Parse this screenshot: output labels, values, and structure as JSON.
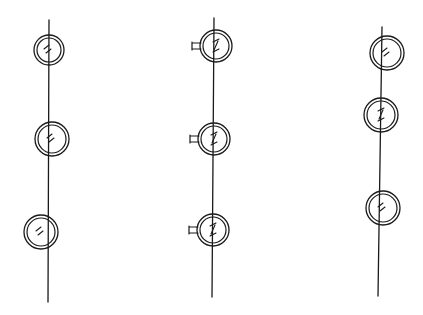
{
  "figure": {
    "width": 423,
    "height": 315,
    "background": "#ffffff",
    "ink_color": "#1a1a1a"
  },
  "columns": [
    {
      "id": "column-1",
      "shaft": {
        "x1": 49,
        "y1": 20,
        "x2": 48,
        "y2": 302
      },
      "elements": [
        {
          "cx": 49,
          "cy": 50,
          "r_outer": 15,
          "r_inner": 12,
          "has_tab": false,
          "mark": "double-dash"
        },
        {
          "cx": 52,
          "cy": 139,
          "r_outer": 17,
          "r_inner": 14,
          "has_tab": false,
          "mark": "double-dash"
        },
        {
          "cx": 41,
          "cy": 232,
          "r_outer": 17,
          "r_inner": 14,
          "has_tab": false,
          "mark": "double-dash"
        }
      ]
    },
    {
      "id": "column-2",
      "shaft": {
        "x1": 214,
        "y1": 18,
        "x2": 212,
        "y2": 297
      },
      "elements": [
        {
          "cx": 216,
          "cy": 46,
          "r_outer": 16,
          "r_inner": 13,
          "has_tab": true,
          "mark": "z-break"
        },
        {
          "cx": 214,
          "cy": 139,
          "r_outer": 16,
          "r_inner": 13,
          "has_tab": true,
          "mark": "z-break"
        },
        {
          "cx": 213,
          "cy": 230,
          "r_outer": 16,
          "r_inner": 13,
          "has_tab": true,
          "mark": "z-break"
        }
      ]
    },
    {
      "id": "column-3",
      "shaft": {
        "x1": 382,
        "y1": 27,
        "x2": 378,
        "y2": 296
      },
      "elements": [
        {
          "cx": 387,
          "cy": 53,
          "r_outer": 17,
          "r_inner": 14,
          "has_tab": false,
          "mark": "double-dash"
        },
        {
          "cx": 381,
          "cy": 115,
          "r_outer": 17,
          "r_inner": 14,
          "has_tab": false,
          "mark": "z-break"
        },
        {
          "cx": 383,
          "cy": 208,
          "r_outer": 17,
          "r_inner": 14,
          "has_tab": false,
          "mark": "double-dash"
        }
      ]
    }
  ]
}
